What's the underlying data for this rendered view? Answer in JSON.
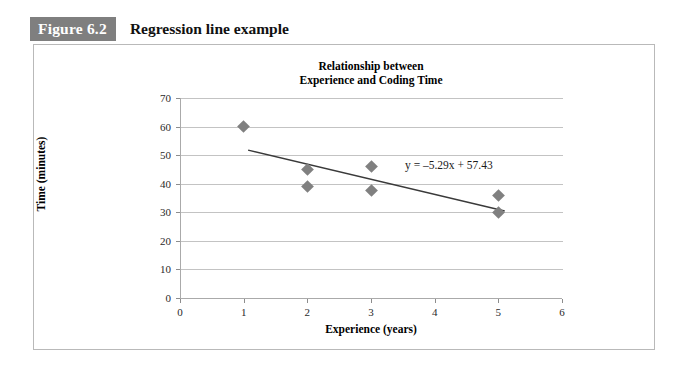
{
  "figure": {
    "number_label": "Figure 6.2",
    "caption": "Regression line example",
    "badge_color": "#7f7f7f",
    "border_color": "#b9b9b9"
  },
  "chart_data": {
    "type": "scatter",
    "title": "Relationship between\nExperience and Coding Time",
    "title_line1": "Relationship between",
    "title_line2": "Experience and Coding Time",
    "xlabel": "Experience (years)",
    "ylabel": "Time (minutes)",
    "xlim": [
      0,
      6
    ],
    "ylim": [
      0,
      70
    ],
    "xticks": [
      0,
      1,
      2,
      3,
      4,
      5,
      6
    ],
    "yticks": [
      0,
      10,
      20,
      30,
      40,
      50,
      60,
      70
    ],
    "xtick_labels": [
      "0",
      "1",
      "2",
      "3",
      "4",
      "5",
      "6"
    ],
    "ytick_labels": [
      "0",
      "10",
      "20",
      "30",
      "40",
      "50",
      "60",
      "70"
    ],
    "grid": "horizontal",
    "legend": "none",
    "marker_shape": "diamond",
    "marker_color": "#808080",
    "line_color": "#3a3a3a",
    "points": [
      {
        "x": 1,
        "y": 60
      },
      {
        "x": 2,
        "y": 45
      },
      {
        "x": 2,
        "y": 39
      },
      {
        "x": 3,
        "y": 46
      },
      {
        "x": 3,
        "y": 37.5
      },
      {
        "x": 5,
        "y": 36
      },
      {
        "x": 5,
        "y": 30
      }
    ],
    "trendline": {
      "equation": "y = –5.29x + 57.43",
      "slope": -5.29,
      "intercept": 57.43,
      "x_start": 1.07,
      "x_end": 5.1
    },
    "annotations": [
      {
        "text": "y = –5.29x + 57.43",
        "x": 3.55,
        "y": 48.5
      }
    ]
  }
}
